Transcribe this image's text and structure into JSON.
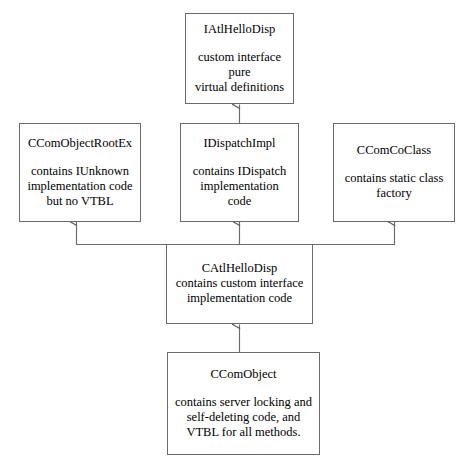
{
  "diagram": {
    "type": "class-hierarchy",
    "style": "uml-inheritance",
    "background_color": "#ffffff",
    "line_color": "#6a6a6a",
    "text_color": "#000000",
    "nodes": [
      {
        "id": "iatlhellodisp",
        "title": "IAtlHelloDisp",
        "body": "custom interface pure virtual definitions",
        "body_lines": [
          "custom interface pure",
          "virtual definitions"
        ],
        "spacing": "gap"
      },
      {
        "id": "ccomobjectrootex",
        "title": "CComObjectRootEx",
        "body": "contains IUnknown implementation code but no VTBL",
        "body_lines": [
          "contains IUnknown",
          "implementation code",
          "but no VTBL"
        ],
        "spacing": "gap"
      },
      {
        "id": "idispatchimpl",
        "title": "IDispatchImpl",
        "body": "contains IDispatch implementation code",
        "body_lines": [
          "contains IDispatch",
          "implementation code"
        ],
        "spacing": "gap"
      },
      {
        "id": "ccomcoclass",
        "title": "CComCoClass",
        "body": "contains static class factory",
        "body_lines": [
          "contains static class",
          "factory"
        ],
        "spacing": "gap"
      },
      {
        "id": "catlhellodisp",
        "title": "CAtlHelloDisp",
        "body": "contains custom interface implementation code",
        "body_lines": [
          "contains custom interface",
          "implementation code"
        ],
        "spacing": "tight"
      },
      {
        "id": "ccomobject",
        "title": "CComObject",
        "body": "contains server locking and self-deleting code, and VTBL for all methods.",
        "body_lines": [
          "contains server locking and",
          "self-deleting code, and",
          "VTBL for all methods."
        ],
        "spacing": "gap"
      }
    ],
    "edges": [
      {
        "from": "idispatchimpl",
        "to": "iatlhellodisp",
        "arrow": "open-up"
      },
      {
        "from": "catlhellodisp",
        "to": "ccomobjectrootex",
        "arrow": "open-up"
      },
      {
        "from": "catlhellodisp",
        "to": "idispatchimpl",
        "arrow": "open-up"
      },
      {
        "from": "catlhellodisp",
        "to": "ccomcoclass",
        "arrow": "open-up"
      },
      {
        "from": "ccomobject",
        "to": "catlhellodisp",
        "arrow": "open-up"
      }
    ]
  }
}
